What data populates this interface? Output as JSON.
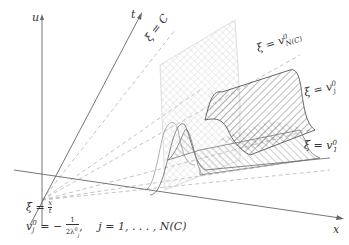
{
  "axes": {
    "u": "u",
    "t": "t",
    "x": "x"
  },
  "line_labels": {
    "xi_c": "ξ = C",
    "xi_nc_prefix": "ξ = v",
    "xi_nc_sup": "0",
    "xi_nc_sub": "N(C)",
    "xi_j_prefix": "ξ = v",
    "xi_j_sup": "0",
    "xi_j_sub": "j",
    "xi_1_prefix": "ξ = v",
    "xi_1_sup": "0",
    "xi_1_sub": "1"
  },
  "formula": {
    "line1": "ξ = x/t",
    "line1_lhs": "ξ =",
    "line1_num": "x",
    "line1_den": "t",
    "line2_lhs": "v",
    "line2_sup": "0",
    "line2_sub": "j",
    "line2_eq": "= −",
    "line2_num": "1",
    "line2_den": "2λ",
    "line2_den_sup": "0",
    "line2_den_sub": "j",
    "line2_range": "j = 1, . . . , N(C)"
  },
  "colors": {
    "axis": "#666666",
    "dashed": "#b0b0b0",
    "hatch_dark": "#555555",
    "hatch_light": "#c8c8c8",
    "text": "#333333"
  }
}
